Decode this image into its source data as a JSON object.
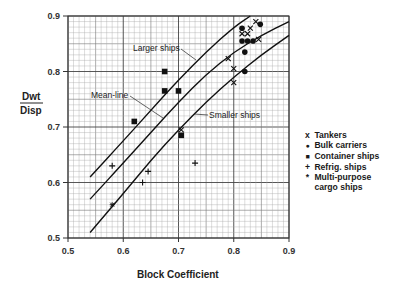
{
  "chart_data": {
    "type": "scatter",
    "title": "",
    "xlabel": "Block Coefficient",
    "ylabel": "Dwt / Disp",
    "xlim": [
      0.5,
      0.9
    ],
    "ylim": [
      0.5,
      0.9
    ],
    "x_ticks": [
      "0.5",
      "0.6",
      "0.7",
      "0.8",
      "0.9"
    ],
    "y_ticks": [
      "0.5",
      "0.6",
      "0.7",
      "0.8",
      "0.9"
    ],
    "grid": true,
    "legend_position": "right",
    "lines": [
      {
        "name": "Larger ships",
        "points": [
          [
            0.54,
            0.61
          ],
          [
            0.6,
            0.675
          ],
          [
            0.65,
            0.73
          ],
          [
            0.7,
            0.785
          ],
          [
            0.75,
            0.835
          ],
          [
            0.8,
            0.88
          ],
          [
            0.83,
            0.9
          ]
        ]
      },
      {
        "name": "Mean line",
        "points": [
          [
            0.54,
            0.57
          ],
          [
            0.6,
            0.635
          ],
          [
            0.65,
            0.69
          ],
          [
            0.7,
            0.745
          ],
          [
            0.75,
            0.795
          ],
          [
            0.8,
            0.835
          ],
          [
            0.85,
            0.865
          ],
          [
            0.9,
            0.89
          ]
        ]
      },
      {
        "name": "Smaller ships",
        "points": [
          [
            0.54,
            0.51
          ],
          [
            0.6,
            0.58
          ],
          [
            0.65,
            0.64
          ],
          [
            0.7,
            0.695
          ],
          [
            0.75,
            0.745
          ],
          [
            0.8,
            0.79
          ],
          [
            0.85,
            0.83
          ],
          [
            0.9,
            0.865
          ]
        ]
      }
    ],
    "series": [
      {
        "name": "Tankers",
        "marker": "x",
        "points": [
          [
            0.705,
            0.695
          ],
          [
            0.79,
            0.823
          ],
          [
            0.8,
            0.805
          ],
          [
            0.8,
            0.78
          ],
          [
            0.815,
            0.868
          ],
          [
            0.825,
            0.868
          ],
          [
            0.83,
            0.878
          ],
          [
            0.845,
            0.858
          ],
          [
            0.84,
            0.89
          ]
        ]
      },
      {
        "name": "Bulk carriers",
        "marker": "circle",
        "points": [
          [
            0.815,
            0.878
          ],
          [
            0.815,
            0.855
          ],
          [
            0.825,
            0.855
          ],
          [
            0.835,
            0.855
          ],
          [
            0.82,
            0.835
          ],
          [
            0.82,
            0.8
          ],
          [
            0.848,
            0.885
          ]
        ]
      },
      {
        "name": "Container ships",
        "marker": "square",
        "points": [
          [
            0.62,
            0.71
          ],
          [
            0.675,
            0.8
          ],
          [
            0.675,
            0.765
          ],
          [
            0.7,
            0.765
          ],
          [
            0.705,
            0.685
          ]
        ]
      },
      {
        "name": "Refrig. ships",
        "marker": "plus",
        "points": [
          [
            0.58,
            0.63
          ],
          [
            0.645,
            0.62
          ],
          [
            0.635,
            0.6
          ],
          [
            0.73,
            0.635
          ]
        ]
      },
      {
        "name": "Multi-purpose cargo ships",
        "marker": "star",
        "points": [
          [
            0.58,
            0.56
          ]
        ]
      }
    ],
    "annotations": [
      "Larger ships",
      "Mean-line",
      "Smaller ships"
    ]
  },
  "labels": {
    "ylabel_top": "Dwt",
    "ylabel_bottom": "Disp",
    "xlabel": "Block Coefficient",
    "larger": "Larger ships",
    "mean": "Mean-line",
    "smaller": "Smaller ships"
  },
  "legend": [
    {
      "symbol": "x",
      "label": "Tankers"
    },
    {
      "symbol": "●",
      "label": "Bulk carriers"
    },
    {
      "symbol": "■",
      "label": "Container ships"
    },
    {
      "symbol": "+",
      "label": "Refrig. ships"
    },
    {
      "symbol": "*",
      "label": "Multi-purpose"
    },
    {
      "symbol": "",
      "label": "cargo ships"
    }
  ]
}
